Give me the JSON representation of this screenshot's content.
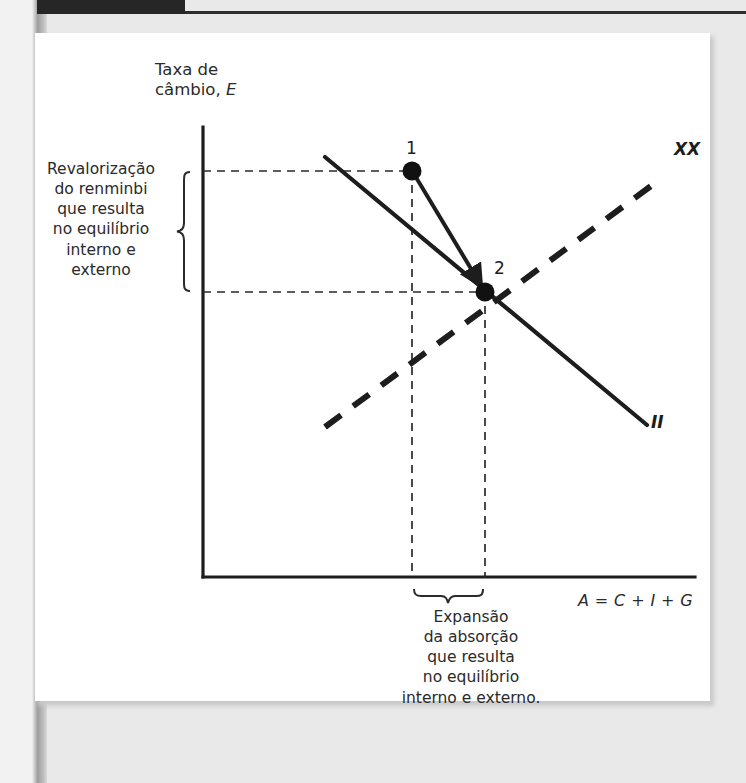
{
  "figure": {
    "axes": {
      "y_label_line1": "Taxa de",
      "y_label_line2_prefix": "câmbio, ",
      "y_label_line2_var": "E",
      "x_label": "A = C + I + G"
    },
    "curves": [
      {
        "name": "internal-balance-line",
        "label": "II",
        "style": "solid",
        "slope": "negative"
      },
      {
        "name": "external-balance-line",
        "label": "XX",
        "style": "dashed",
        "slope": "positive"
      }
    ],
    "points": [
      {
        "id": "1",
        "label": "1",
        "role": "initial-equilibrium"
      },
      {
        "id": "2",
        "label": "2",
        "role": "new-equilibrium"
      }
    ],
    "annotations": {
      "left": {
        "lines": [
          "Revalorização",
          "do renminbi",
          "que resulta",
          "no equilíbrio",
          "interno e",
          "externo"
        ]
      },
      "bottom": {
        "lines": [
          "Expansão",
          "da absorção",
          "que resulta",
          "no equilíbrio",
          "interno e externo."
        ]
      }
    },
    "colors": {
      "ink": "#1d1d1d",
      "text": "#2a2a2a",
      "card": "#ffffff",
      "page": "#e9e9e9",
      "header_bar": "#262626"
    }
  }
}
